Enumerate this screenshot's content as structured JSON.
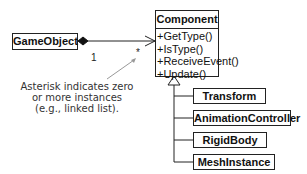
{
  "diagram": {
    "type": "uml-class-diagram",
    "owner_class": {
      "name": "GameObject"
    },
    "component_class": {
      "name": "Component",
      "methods": [
        "+GetType()",
        "+IsType()",
        "+ReceiveEvent()",
        "+Update()"
      ]
    },
    "association": {
      "kind": "composition",
      "from": "GameObject",
      "to": "Component",
      "owner_multiplicity": "1",
      "component_multiplicity": "*"
    },
    "annotation": {
      "lines": [
        "Asterisk indicates zero",
        "or more instances",
        "(e.g., linked list)."
      ]
    },
    "subclasses": [
      {
        "name": "Transform"
      },
      {
        "name": "AnimationController"
      },
      {
        "name": "RigidBody"
      },
      {
        "name": "MeshInstance"
      }
    ],
    "colors": {
      "line": "#222222",
      "annotation_text": "#333333",
      "annotation_arrow": "#999999",
      "background": "#ffffff"
    }
  }
}
